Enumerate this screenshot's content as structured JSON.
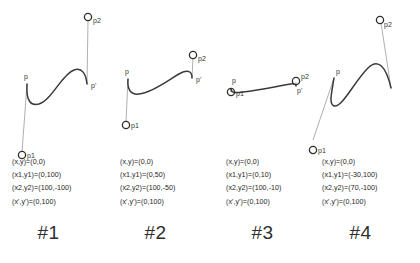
{
  "figure": {
    "background_color": "#ffffff",
    "stroke_color": "#3a3a3a",
    "tangent_color": "#8a8a8a"
  },
  "panels": [
    {
      "id": "panel-1",
      "label": "#1",
      "point_labels": {
        "p": "p",
        "p_prime": "p'",
        "p1": "p1",
        "p2": "p2"
      },
      "equations": [
        "(x,y)=(0,0)",
        "(x1,y1)=(0,100)",
        "(x2,y2)=(100,-100)",
        "(x',y')=(0,100)"
      ]
    },
    {
      "id": "panel-2",
      "label": "#2",
      "point_labels": {
        "p": "p",
        "p_prime": "p'",
        "p1": "p1",
        "p2": "p2"
      },
      "equations": [
        "(x,y)=(0,0)",
        "(x1,y1)=(0,50)",
        "(x2,y2)=(100,-50)",
        "(x',y')=(0,100)"
      ]
    },
    {
      "id": "panel-3",
      "label": "#3",
      "point_labels": {
        "p": "p",
        "p_prime": "p'",
        "p1": "p1",
        "p2": "p2"
      },
      "equations": [
        "(x,y)=(0,0)",
        "(x1,y1)=(0,10)",
        "(x2,y2)=(100,-10)",
        "(x',y')=(0,100)"
      ]
    },
    {
      "id": "panel-4",
      "label": "#4",
      "point_labels": {
        "p": "p",
        "p_prime": "p'",
        "p1": "p1",
        "p2": "p2"
      },
      "equations": [
        "(x,y)=(0,0)",
        "(x1,y1)=(-30,100)",
        "(x2,y2)=(70,-100)",
        "(x',y')=(0,100)"
      ]
    }
  ]
}
